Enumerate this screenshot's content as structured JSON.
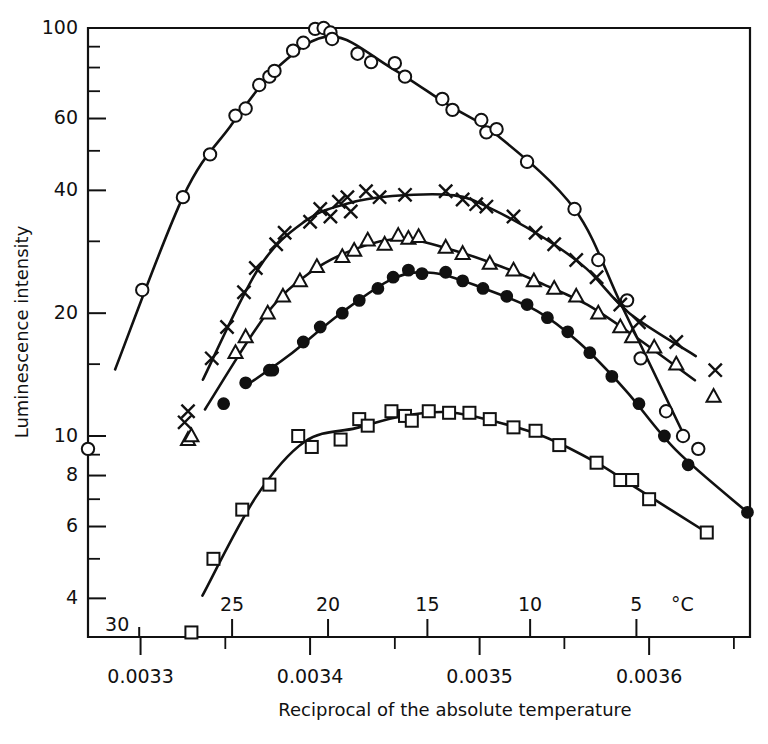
{
  "chart_data": {
    "type": "scatter",
    "title": "",
    "xlabel": "Reciprocal of the absolute temperature",
    "ylabel": "Luminescence intensity",
    "yscale": "log",
    "ylim": [
      3.1,
      100
    ],
    "xlim": [
      0.003269,
      0.0036595
    ],
    "grid": false,
    "legend": "none",
    "y_ticks_labeled": [
      100,
      60,
      40,
      20,
      10,
      8,
      6,
      4
    ],
    "y_ticks_minor": [
      90,
      80,
      70,
      50,
      30,
      15,
      9,
      7,
      5
    ],
    "x_ticks_labeled": [
      "0.0033",
      "0.0034",
      "0.0035",
      "0.0036"
    ],
    "x_ticks_labeled_values": [
      0.0033,
      0.0034,
      0.0035,
      0.0036
    ],
    "x_ticks_minor_values": [
      0.00335,
      0.00345,
      0.00355,
      0.00365
    ],
    "secondary_axis": {
      "label": "°C",
      "unit_label": "°C",
      "ticks": [
        30,
        25,
        20,
        15,
        10,
        5
      ],
      "tick_reciprocal_values": [
        0.0032992,
        0.003354,
        0.0034106,
        0.0034692,
        0.0035298,
        0.0035925
      ]
    },
    "series": [
      {
        "name": "open-circle",
        "marker": "circle-open",
        "peak_value": 100,
        "points": [
          [
            0.003269,
            9.3
          ],
          [
            0.003301,
            22.8
          ],
          [
            0.003325,
            38.5
          ],
          [
            0.003341,
            49.0
          ],
          [
            0.003356,
            61.0
          ],
          [
            0.003362,
            63.5
          ],
          [
            0.00337,
            72.5
          ],
          [
            0.003376,
            76.0
          ],
          [
            0.003379,
            78.5
          ],
          [
            0.00339,
            88.0
          ],
          [
            0.003396,
            92.0
          ],
          [
            0.003403,
            99.5
          ],
          [
            0.003408,
            100.0
          ],
          [
            0.003412,
            97.5
          ],
          [
            0.003413,
            94.0
          ],
          [
            0.003428,
            86.5
          ],
          [
            0.003436,
            82.5
          ],
          [
            0.00345,
            82.0
          ],
          [
            0.003456,
            76.0
          ],
          [
            0.003478,
            67.0
          ],
          [
            0.003484,
            63.0
          ],
          [
            0.003501,
            59.5
          ],
          [
            0.003504,
            55.5
          ],
          [
            0.00351,
            56.5
          ],
          [
            0.003528,
            47.0
          ],
          [
            0.003556,
            36.0
          ],
          [
            0.00357,
            27.0
          ],
          [
            0.003587,
            21.5
          ],
          [
            0.003595,
            15.5
          ],
          [
            0.00361,
            11.5
          ],
          [
            0.00362,
            10.0
          ],
          [
            0.003629,
            9.3
          ]
        ]
      },
      {
        "name": "cross",
        "marker": "cross",
        "peak_value": 40,
        "points": [
          [
            0.003326,
            10.8
          ],
          [
            0.003328,
            11.5
          ],
          [
            0.003342,
            15.5
          ],
          [
            0.003351,
            18.5
          ],
          [
            0.003361,
            22.5
          ],
          [
            0.003368,
            25.8
          ],
          [
            0.00338,
            29.5
          ],
          [
            0.003385,
            31.5
          ],
          [
            0.0034,
            33.5
          ],
          [
            0.003406,
            36.0
          ],
          [
            0.003412,
            34.5
          ],
          [
            0.003417,
            37.5
          ],
          [
            0.003422,
            38.5
          ],
          [
            0.003424,
            35.5
          ],
          [
            0.003433,
            39.8
          ],
          [
            0.003441,
            38.5
          ],
          [
            0.003456,
            39.0
          ],
          [
            0.00348,
            39.8
          ],
          [
            0.00349,
            38.0
          ],
          [
            0.003498,
            37.0
          ],
          [
            0.003504,
            36.5
          ],
          [
            0.00352,
            34.5
          ],
          [
            0.003533,
            31.5
          ],
          [
            0.003544,
            29.5
          ],
          [
            0.003557,
            27.0
          ],
          [
            0.003569,
            24.5
          ],
          [
            0.003583,
            21.0
          ],
          [
            0.003594,
            19.0
          ],
          [
            0.003616,
            17.0
          ],
          [
            0.003639,
            14.5
          ]
        ]
      },
      {
        "name": "open-triangle",
        "marker": "triangle-open",
        "peak_value": 31,
        "points": [
          [
            0.003328,
            9.8
          ],
          [
            0.00333,
            10.0
          ],
          [
            0.003356,
            16.0
          ],
          [
            0.003362,
            17.5
          ],
          [
            0.003375,
            20.0
          ],
          [
            0.003384,
            22.0
          ],
          [
            0.003394,
            24.0
          ],
          [
            0.003404,
            26.0
          ],
          [
            0.003419,
            27.5
          ],
          [
            0.003426,
            28.5
          ],
          [
            0.003434,
            30.2
          ],
          [
            0.003444,
            29.5
          ],
          [
            0.003452,
            31.0
          ],
          [
            0.003458,
            30.5
          ],
          [
            0.003464,
            30.8
          ],
          [
            0.00348,
            29.0
          ],
          [
            0.00349,
            28.0
          ],
          [
            0.003506,
            26.5
          ],
          [
            0.00352,
            25.5
          ],
          [
            0.003532,
            24.0
          ],
          [
            0.003544,
            23.0
          ],
          [
            0.003557,
            22.0
          ],
          [
            0.00357,
            20.0
          ],
          [
            0.003583,
            18.5
          ],
          [
            0.00359,
            17.5
          ],
          [
            0.003603,
            16.5
          ],
          [
            0.003616,
            15.0
          ],
          [
            0.003638,
            12.5
          ]
        ]
      },
      {
        "name": "filled-circle",
        "marker": "circle-filled",
        "peak_value": 25.5,
        "points": [
          [
            0.003349,
            12.0
          ],
          [
            0.003362,
            13.5
          ],
          [
            0.003376,
            14.5
          ],
          [
            0.003378,
            14.5
          ],
          [
            0.003396,
            17.0
          ],
          [
            0.003406,
            18.5
          ],
          [
            0.003419,
            20.0
          ],
          [
            0.003429,
            21.5
          ],
          [
            0.00344,
            23.0
          ],
          [
            0.003449,
            24.5
          ],
          [
            0.003458,
            25.5
          ],
          [
            0.003466,
            25.0
          ],
          [
            0.00348,
            25.2
          ],
          [
            0.00349,
            24.0
          ],
          [
            0.003502,
            23.0
          ],
          [
            0.003516,
            22.0
          ],
          [
            0.003528,
            21.0
          ],
          [
            0.00354,
            19.5
          ],
          [
            0.003552,
            18.0
          ],
          [
            0.003565,
            16.0
          ],
          [
            0.003578,
            14.0
          ],
          [
            0.003594,
            12.0
          ],
          [
            0.003609,
            10.0
          ],
          [
            0.003623,
            8.5
          ],
          [
            0.003658,
            6.5
          ]
        ]
      },
      {
        "name": "open-square",
        "marker": "square-open",
        "peak_value": 11.5,
        "points": [
          [
            0.00333,
            3.3
          ],
          [
            0.003343,
            5.0
          ],
          [
            0.00336,
            6.6
          ],
          [
            0.003376,
            7.6
          ],
          [
            0.003393,
            10.0
          ],
          [
            0.003401,
            9.4
          ],
          [
            0.003418,
            9.8
          ],
          [
            0.003429,
            11.0
          ],
          [
            0.003434,
            10.6
          ],
          [
            0.003448,
            11.5
          ],
          [
            0.003456,
            11.2
          ],
          [
            0.00346,
            10.9
          ],
          [
            0.00347,
            11.5
          ],
          [
            0.003482,
            11.4
          ],
          [
            0.003494,
            11.4
          ],
          [
            0.003506,
            11.0
          ],
          [
            0.00352,
            10.5
          ],
          [
            0.003533,
            10.3
          ],
          [
            0.003547,
            9.5
          ],
          [
            0.003569,
            8.6
          ],
          [
            0.003583,
            7.8
          ],
          [
            0.00359,
            7.8
          ],
          [
            0.0036,
            7.0
          ],
          [
            0.003634,
            5.8
          ]
        ]
      }
    ]
  },
  "axes": {
    "y_labels": [
      "100",
      "60",
      "40",
      "20",
      "10",
      "8",
      "6",
      "4"
    ],
    "x_labels": [
      "0.0033",
      "0.0034",
      "0.0035",
      "0.0036"
    ],
    "celsius_labels": [
      "30",
      "25",
      "20",
      "15",
      "10",
      "5"
    ],
    "celsius_unit": "°C",
    "x_axis_title": "Reciprocal of the absolute temperature",
    "y_axis_title": "Luminescence intensity"
  },
  "colors": {
    "ink": "#111111",
    "background": "#ffffff"
  }
}
